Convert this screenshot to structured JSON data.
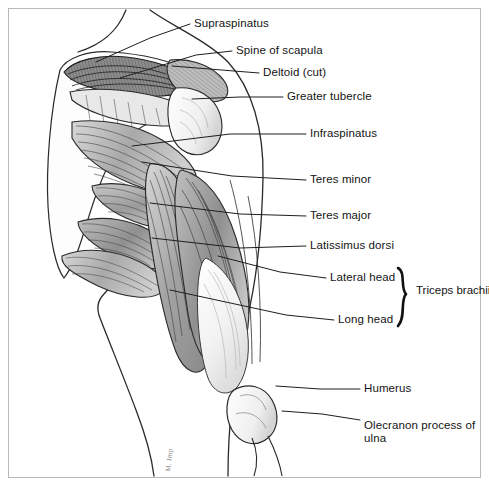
{
  "figure": {
    "background_color": "#ffffff",
    "border_color": "#b9b9b9",
    "ink_color": "#141414",
    "artist_signature": "M. Imp"
  },
  "labels": [
    {
      "id": "supraspinatus",
      "text": "Supraspinatus",
      "x": 194,
      "y": 17,
      "leader": "M 190 24 L 150 38 L 96 62"
    },
    {
      "id": "spine-of-scapula",
      "text": "Spine of scapula",
      "x": 236,
      "y": 44,
      "leader": "M 232 51 L 196 55 L 120 78"
    },
    {
      "id": "deltoid-cut",
      "text": "Deltoid (cut)",
      "x": 263,
      "y": 66,
      "leader": "M 259 73 L 234 71 L 172 66"
    },
    {
      "id": "greater-tubercle",
      "text": "Greater tubercle",
      "x": 287,
      "y": 90,
      "leader": "M 283 97 L 240 97 L 192 99"
    },
    {
      "id": "infraspinatus",
      "text": "Infraspinatus",
      "x": 310,
      "y": 127,
      "leader": "M 306 134 L 230 134 L 132 146"
    },
    {
      "id": "teres-minor",
      "text": "Teres minor",
      "x": 310,
      "y": 173,
      "leader": "M 306 180 L 232 176 L 142 162"
    },
    {
      "id": "teres-major",
      "text": "Teres major",
      "x": 310,
      "y": 209,
      "leader": "M 306 216 L 240 214 L 150 203"
    },
    {
      "id": "latissimus-dorsi",
      "text": "Latissimus dorsi",
      "x": 310,
      "y": 239,
      "leader": "M 306 246 L 240 248 L 152 238"
    },
    {
      "id": "lateral-head",
      "text": "Lateral head",
      "x": 330,
      "y": 271,
      "leader": "M 326 278 L 280 272 L 218 256"
    },
    {
      "id": "long-head",
      "text": "Long head",
      "x": 338,
      "y": 313,
      "leader": "M 334 320 L 286 315 L 170 290"
    },
    {
      "id": "humerus",
      "text": "Humerus",
      "x": 364,
      "y": 382,
      "leader": "M 360 389 L 320 389 L 276 386"
    },
    {
      "id": "olecranon",
      "text": "Olecranon process of ulna",
      "x": 364,
      "y": 419,
      "wrap": true,
      "leader": "M 360 420 L 322 414 L 282 411"
    }
  ],
  "brace_group": {
    "label": "Triceps brachii",
    "label_x": 416,
    "label_y": 290,
    "members": [
      "Lateral head",
      "Long head"
    ],
    "top_y": 268,
    "bottom_y": 326,
    "x": 400
  }
}
